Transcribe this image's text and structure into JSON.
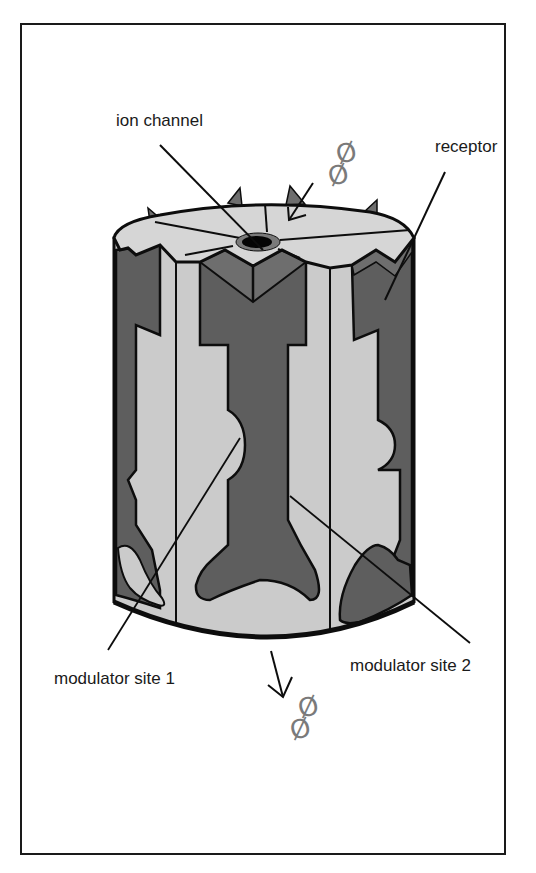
{
  "figure": {
    "colors": {
      "frame": "#1a1a1a",
      "light_subunit": "#cbcbcb",
      "dark_subunit": "#5e5e5e",
      "mid_subunit": "#6e6e6e",
      "top_face": "#d6d6d6",
      "channel_pore": "#050505",
      "channel_ring": "#7a7a7a",
      "molecule": "#7a7a7a",
      "outline": "#0d0d0d"
    }
  },
  "labels": {
    "ion_channel": "ion channel",
    "receptor": "receptor",
    "modulator_site_1": "modulator site 1",
    "modulator_site_2": "modulator site 2"
  },
  "molecules": {
    "top_glyph_1": "Ø",
    "top_glyph_2": "Ø",
    "bottom_glyph_1": "Ø",
    "bottom_glyph_2": "Ø"
  }
}
